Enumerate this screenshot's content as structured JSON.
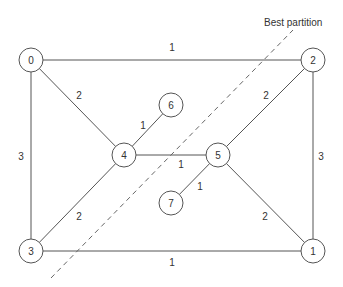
{
  "diagram": {
    "type": "weighted-graph-partition",
    "annotation": "Best partition",
    "nodes": [
      {
        "id": "0",
        "label": "0",
        "x": 31,
        "y": 60
      },
      {
        "id": "1",
        "label": "1",
        "x": 313,
        "y": 251
      },
      {
        "id": "2",
        "label": "2",
        "x": 313,
        "y": 60
      },
      {
        "id": "3",
        "label": "3",
        "x": 31,
        "y": 251
      },
      {
        "id": "4",
        "label": "4",
        "x": 124,
        "y": 155
      },
      {
        "id": "5",
        "label": "5",
        "x": 218,
        "y": 155
      },
      {
        "id": "6",
        "label": "6",
        "x": 171,
        "y": 105
      },
      {
        "id": "7",
        "label": "7",
        "x": 171,
        "y": 203
      }
    ],
    "edges": [
      {
        "from": "0",
        "to": "2",
        "weight": "1",
        "label_x": 172,
        "label_y": 47
      },
      {
        "from": "0",
        "to": "3",
        "weight": "3",
        "label_x": 21,
        "label_y": 156
      },
      {
        "from": "0",
        "to": "4",
        "weight": "2",
        "label_x": 79,
        "label_y": 95
      },
      {
        "from": "2",
        "to": "1",
        "weight": "3",
        "label_x": 321,
        "label_y": 156
      },
      {
        "from": "2",
        "to": "5",
        "weight": "2",
        "label_x": 266,
        "label_y": 95
      },
      {
        "from": "3",
        "to": "1",
        "weight": "1",
        "label_x": 172,
        "label_y": 262
      },
      {
        "from": "3",
        "to": "4",
        "weight": "2",
        "label_x": 79,
        "label_y": 216
      },
      {
        "from": "5",
        "to": "1",
        "weight": "2",
        "label_x": 265,
        "label_y": 216
      },
      {
        "from": "4",
        "to": "5",
        "weight": "1",
        "label_x": 181,
        "label_y": 164
      },
      {
        "from": "4",
        "to": "6",
        "weight": "1",
        "label_x": 143,
        "label_y": 125
      },
      {
        "from": "5",
        "to": "7",
        "weight": "1",
        "label_x": 200,
        "label_y": 186
      }
    ],
    "partition_line": {
      "x1": 51,
      "y1": 278,
      "x2": 293,
      "y2": 30
    },
    "annotation_position": {
      "x": 264,
      "y": 22
    },
    "node_radius": 12
  }
}
